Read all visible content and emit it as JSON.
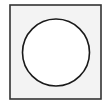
{
  "diagram": {
    "type": "shape",
    "square": {
      "x": 10,
      "y": 5,
      "width": 91,
      "height": 94,
      "fill": "#f3f3f3",
      "stroke": "#333333",
      "stroke_width": 1.6
    },
    "circle": {
      "cx": 56,
      "cy": 52.5,
      "r": 33.5,
      "fill": "#ffffff",
      "stroke": "#1a1a1a",
      "stroke_width": 1.6
    }
  }
}
